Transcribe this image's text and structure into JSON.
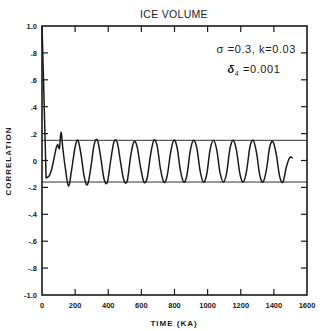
{
  "chart_data": {
    "type": "line",
    "title": "ICE VOLUME",
    "xlabel": "TIME (KA)",
    "ylabel": "CORRELATION",
    "xlim": [
      0,
      1600
    ],
    "ylim": [
      -1.0,
      1.0
    ],
    "grid": false,
    "x_ticks": [
      0,
      200,
      400,
      600,
      800,
      1000,
      1200,
      1400,
      1600
    ],
    "x_tick_labels": [
      "0",
      "200",
      "400",
      "600",
      "800",
      "1000",
      "1200",
      "1400",
      "1600"
    ],
    "y_ticks": [
      1.0,
      0.8,
      0.6,
      0.4,
      0.2,
      0,
      -0.2,
      -0.4,
      -0.6,
      -0.8,
      -1.0
    ],
    "y_tick_labels": [
      "1.0",
      ".8",
      ".6",
      ".4",
      ".2",
      "0",
      "-.2",
      "-.4",
      "-.6",
      "-.8",
      "-1.0"
    ],
    "annotations": [
      {
        "text": "σ =0.3,  k=0.03",
        "position": "upper-right"
      },
      {
        "text_symbol": "δ",
        "text_sub": "4",
        "text_value": " =0.001",
        "position": "upper-right-second-line"
      }
    ],
    "reference_lines": [
      {
        "orientation": "horizontal",
        "y": 0.15
      },
      {
        "orientation": "horizontal",
        "y": -0.16
      }
    ],
    "series": [
      {
        "name": "autocorrelation",
        "x": [
          0,
          10,
          25,
          40,
          55,
          70,
          85,
          95,
          105,
          115,
          125,
          140,
          160,
          180,
          200,
          217,
          235,
          255,
          275,
          295,
          315,
          335,
          355,
          375,
          395,
          415,
          435,
          455,
          475,
          495,
          515,
          535,
          555,
          575,
          595,
          615,
          635,
          655,
          675,
          695,
          715,
          735,
          755,
          775,
          795,
          815,
          835,
          855,
          875,
          895,
          915,
          935,
          955,
          975,
          995,
          1015,
          1035,
          1055,
          1075,
          1095,
          1115,
          1135,
          1155,
          1175,
          1195,
          1215,
          1235,
          1255,
          1275,
          1295,
          1315,
          1335,
          1355,
          1375,
          1395,
          1415,
          1435,
          1455,
          1475,
          1495,
          1515
        ],
        "values": [
          1.0,
          0.55,
          -0.13,
          -0.12,
          -0.08,
          0.0,
          0.09,
          0.12,
          0.09,
          0.21,
          0.1,
          -0.05,
          -0.19,
          -0.06,
          0.1,
          0.15,
          0.05,
          -0.12,
          -0.18,
          -0.05,
          0.12,
          0.15,
          0.02,
          -0.14,
          -0.16,
          0.0,
          0.14,
          0.13,
          -0.02,
          -0.15,
          -0.15,
          0.03,
          0.14,
          0.1,
          -0.05,
          -0.16,
          -0.13,
          0.04,
          0.15,
          0.11,
          -0.06,
          -0.16,
          -0.12,
          0.05,
          0.15,
          0.1,
          -0.07,
          -0.16,
          -0.11,
          0.07,
          0.15,
          0.09,
          -0.08,
          -0.16,
          -0.1,
          0.08,
          0.15,
          0.08,
          -0.09,
          -0.16,
          -0.09,
          0.09,
          0.15,
          0.07,
          -0.1,
          -0.16,
          -0.08,
          0.1,
          0.15,
          0.06,
          -0.11,
          -0.16,
          -0.07,
          0.1,
          0.14,
          0.04,
          -0.12,
          -0.16,
          -0.05,
          0.02,
          0.02
        ]
      }
    ],
    "legend": null
  }
}
